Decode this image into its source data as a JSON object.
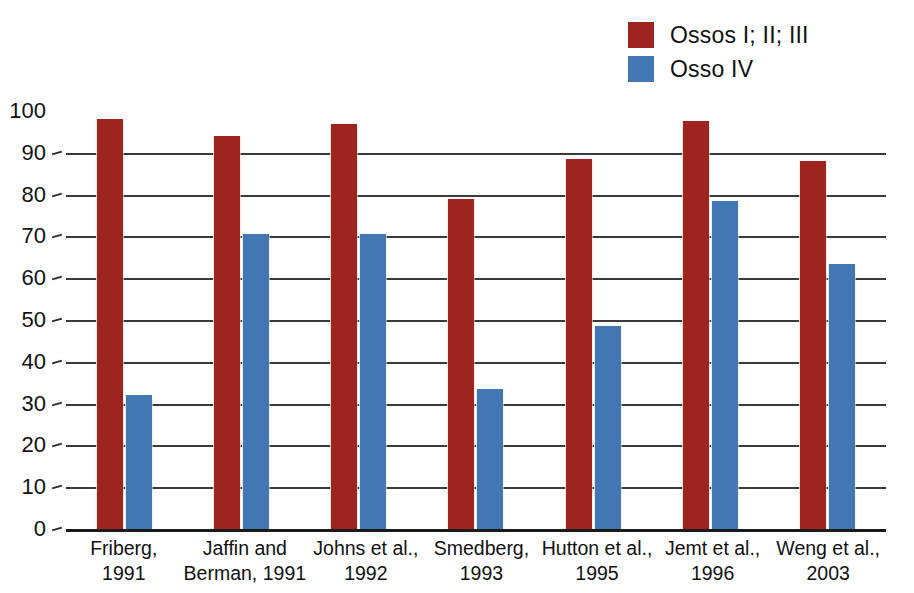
{
  "legend": {
    "position": "top-right",
    "entries": [
      {
        "label": "Ossos I; II; III",
        "color": "#9e2420",
        "swatch_name": "legend-swatch-ossos-i-ii-iii"
      },
      {
        "label": "Osso IV",
        "color": "#4377b4",
        "swatch_name": "legend-swatch-osso-iv"
      }
    ]
  },
  "chart_data": {
    "type": "bar",
    "title": "",
    "subtitle": "",
    "xlabel": "",
    "ylabel": "",
    "ylim": [
      0,
      100
    ],
    "ytick_step": 10,
    "yticks": [
      "100",
      "90",
      "80",
      "70",
      "60",
      "50",
      "40",
      "30",
      "20",
      "10",
      "0"
    ],
    "grid": true,
    "legend_position": "top-right",
    "categories": [
      "Friberg,\n1991",
      "Jaffin and\nBerman, 1991",
      "Johns et al.,\n1992",
      "Smedberg,\n1993",
      "Hutton et al.,\n1995",
      "Jemt et al.,\n1996",
      "Weng et al.,\n2003"
    ],
    "category_lines": [
      [
        "Friberg,",
        "1991"
      ],
      [
        "Jaffin and",
        "Berman, 1991"
      ],
      [
        "Johns et al.,",
        "1992"
      ],
      [
        "Smedberg,",
        "1993"
      ],
      [
        "Hutton et al.,",
        "1995"
      ],
      [
        "Jemt et al.,",
        "1996"
      ],
      [
        "Weng et al.,",
        "2003"
      ]
    ],
    "series": [
      {
        "name": "Ossos I; II; III",
        "color": "#9e2420",
        "values": [
          98,
          94,
          97,
          79,
          88.5,
          97.5,
          88
        ]
      },
      {
        "name": "Osso IV",
        "color": "#4377b4",
        "values": [
          32,
          70.5,
          70.5,
          33.5,
          48.5,
          78.5,
          63.5
        ]
      }
    ]
  }
}
